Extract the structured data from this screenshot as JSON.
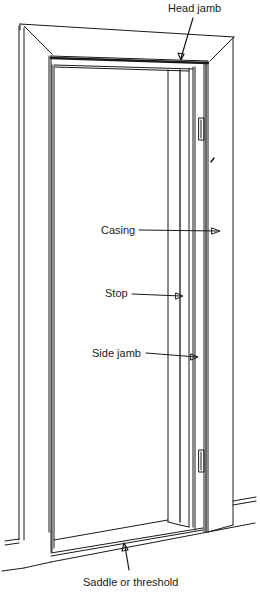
{
  "diagram": {
    "colors": {
      "ink": "#1a1a1a",
      "background": "#ffffff"
    },
    "labels": [
      {
        "id": "head-jamb",
        "text": "Head jamb",
        "x": 168,
        "y": 2
      },
      {
        "id": "casing",
        "text": "Casing",
        "x": 101,
        "y": 74
      },
      {
        "id": "stop",
        "text": "Stop",
        "x": 105,
        "y": 137
      },
      {
        "id": "side-jamb",
        "text": "Side jamb",
        "x": 92,
        "y": 47
      },
      {
        "id": "saddle",
        "text": "Saddle or threshold",
        "x": 83,
        "y": 576
      }
    ]
  }
}
